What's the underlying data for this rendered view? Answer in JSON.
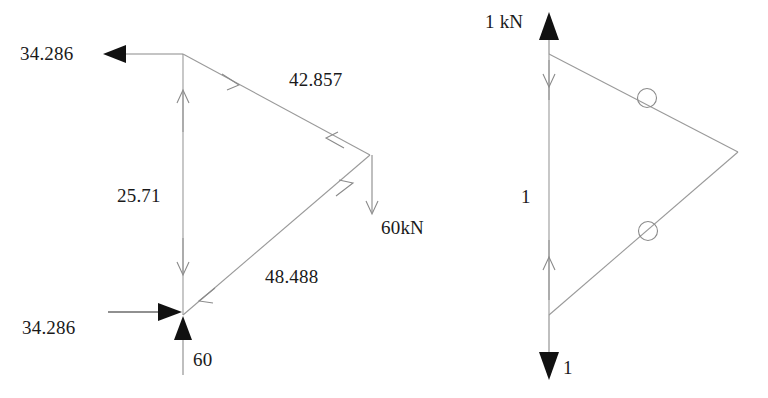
{
  "figure": {
    "stroke_color": "#8a8a8a",
    "solid_arrow_color": "#111111",
    "text_color": "#1a1a1a",
    "background": "#ffffff"
  },
  "left_diagram": {
    "name": "member-force-diagram",
    "units_note": "kN",
    "labels": {
      "top_reaction": "34.286",
      "top_chord": "42.857",
      "vertical_member": "25.71",
      "bottom_chord": "48.488",
      "applied_load": "60kN",
      "bottom_reaction_horizontal": "34.286",
      "bottom_reaction_vertical": "60"
    },
    "members": [
      {
        "name": "vertical-member",
        "label": "25.71",
        "sense": "compression"
      },
      {
        "name": "top-chord-member",
        "label": "42.857",
        "sense": "compression"
      },
      {
        "name": "bottom-chord-member",
        "label": "48.488",
        "sense": "tension"
      }
    ],
    "forces": [
      {
        "name": "top-horizontal-reaction",
        "label": "34.286",
        "direction": "left"
      },
      {
        "name": "bottom-horizontal-reaction",
        "label": "34.286",
        "direction": "right"
      },
      {
        "name": "bottom-vertical-reaction",
        "label": "60",
        "direction": "up"
      },
      {
        "name": "applied-vertical-load",
        "label": "60kN",
        "direction": "down"
      }
    ]
  },
  "right_diagram": {
    "name": "unit-load-diagram",
    "labels": {
      "top_force": "1 kN",
      "vertical_member": "1",
      "bottom_force": "1"
    },
    "members": [
      {
        "name": "vertical-member",
        "label": "1",
        "sense": "tension"
      },
      {
        "name": "top-chord-member",
        "label": "",
        "sense": "zero-force"
      },
      {
        "name": "bottom-chord-member",
        "label": "",
        "sense": "zero-force"
      }
    ],
    "markers": [
      {
        "name": "zero-force-marker-top",
        "symbol": "circle"
      },
      {
        "name": "zero-force-marker-bottom",
        "symbol": "circle"
      }
    ],
    "forces": [
      {
        "name": "top-unit-force",
        "label": "1 kN",
        "direction": "up"
      },
      {
        "name": "bottom-unit-force",
        "label": "1",
        "direction": "down"
      }
    ]
  }
}
